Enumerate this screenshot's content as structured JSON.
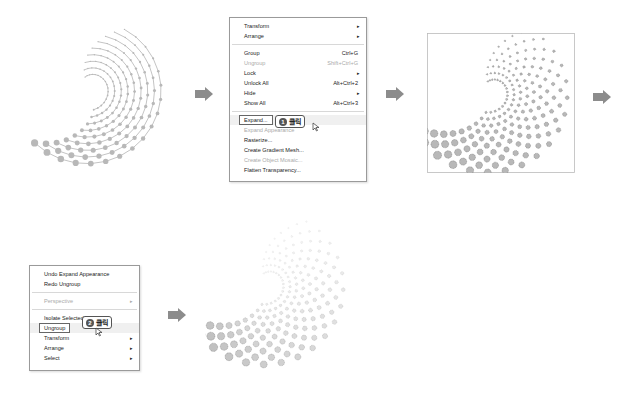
{
  "step1_menu": {
    "items": [
      {
        "label": "Transform",
        "submenu": true
      },
      {
        "label": "Arrange",
        "submenu": true
      },
      {
        "separator": true
      },
      {
        "label": "Group",
        "shortcut": "Ctrl+G"
      },
      {
        "label": "Ungroup",
        "shortcut": "Shift+Ctrl+G",
        "disabled": true
      },
      {
        "label": "Lock",
        "submenu": true
      },
      {
        "label": "Unlock All",
        "shortcut": "Alt+Ctrl+2"
      },
      {
        "label": "Hide",
        "submenu": true
      },
      {
        "label": "Show All",
        "shortcut": "Alt+Ctrl+3"
      },
      {
        "separator": true
      },
      {
        "label": "Expand...",
        "highlighted": true
      },
      {
        "label": "Expand Appearance",
        "disabled": true
      },
      {
        "label": "Rasterize..."
      },
      {
        "label": "Create Gradient Mesh..."
      },
      {
        "label": "Create Object Mosaic...",
        "disabled": true
      },
      {
        "label": "Flatten Transparency..."
      }
    ],
    "callout": {
      "number": "1",
      "text": "클릭"
    }
  },
  "step2_menu": {
    "items": [
      {
        "label": "Undo Expand Appearance"
      },
      {
        "label": "Redo Ungroup"
      },
      {
        "separator": true
      },
      {
        "label": "Perspective",
        "submenu": true,
        "disabled": true
      },
      {
        "separator": true
      },
      {
        "label": "Isolate Selected Group"
      },
      {
        "label": "Ungroup",
        "highlighted": true
      },
      {
        "label": "Transform",
        "submenu": true
      },
      {
        "label": "Arrange",
        "submenu": true
      },
      {
        "label": "Select",
        "submenu": true
      }
    ],
    "callout": {
      "number": "2",
      "text": "클릭"
    }
  },
  "icons": {
    "arrow": "right-arrow-icon",
    "submenu": "▸",
    "cursor": "pointer-cursor-icon"
  },
  "colors": {
    "arrow": "#8c8c8c",
    "dot_fill": "#b8b8b8",
    "dot_stroke": "#777777",
    "menu_border": "#9a9a9a"
  }
}
